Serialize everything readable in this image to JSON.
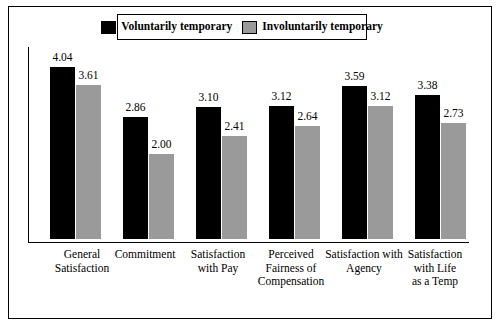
{
  "chart_data": {
    "type": "bar",
    "title": "",
    "xlabel": "",
    "ylabel": "",
    "ylim": [
      0,
      4.5
    ],
    "grid": false,
    "legend_position": "top-center",
    "categories": [
      "General Satisfaction",
      "Commitment",
      "Satisfaction with Pay",
      "Perceived Fairness of Compensation",
      "Satisfaction with Agency",
      "Satisfaction with Life as a Temp"
    ],
    "category_lines": [
      [
        "General",
        "Satisfaction"
      ],
      [
        "Commitment"
      ],
      [
        "Satisfaction",
        "with Pay"
      ],
      [
        "Perceived",
        "Fairness of",
        "Compensation"
      ],
      [
        "Satisfaction with",
        "Agency"
      ],
      [
        "Satisfaction",
        "with Life",
        "as a Temp"
      ]
    ],
    "series": [
      {
        "name": "Voluntarily temporary",
        "color": "#000000",
        "values": [
          4.04,
          2.86,
          3.1,
          3.12,
          3.59,
          3.38
        ],
        "labels": [
          "4.04",
          "2.86",
          "3.10",
          "3.12",
          "3.59",
          "3.38"
        ]
      },
      {
        "name": "Involuntarily temporary",
        "color": "#9a9a9a",
        "values": [
          3.61,
          2.0,
          2.41,
          2.64,
          3.12,
          2.73
        ],
        "labels": [
          "3.61",
          "2.00",
          "2.41",
          "2.64",
          "3.12",
          "2.73"
        ]
      }
    ]
  },
  "legend": {
    "items": [
      {
        "label": "Voluntarily temporary",
        "swatch": "black-square-swatch"
      },
      {
        "label": "Involuntarily temporary",
        "swatch": "gray-square-swatch"
      }
    ]
  }
}
